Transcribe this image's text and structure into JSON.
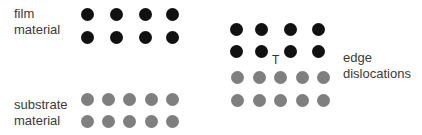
{
  "labels": {
    "film": [
      "film",
      "material"
    ],
    "substrate": [
      "substrate",
      "material"
    ],
    "dislocation": [
      "edge",
      "dislocations"
    ]
  },
  "dislocation_symbol": "T",
  "colors": {
    "film_atom": "#111111",
    "substrate_atom": "#7f7f7f",
    "text": "#3a3a3a",
    "background": "#ffffff"
  },
  "lattices": {
    "left": {
      "film": {
        "rows": 2,
        "cols": 4,
        "x": [
          87,
          116,
          145,
          172
        ],
        "y": [
          14,
          37
        ]
      },
      "substrate": {
        "rows": 2,
        "cols": 5,
        "x": [
          87,
          108,
          129,
          151,
          172
        ],
        "y": [
          99,
          121
        ]
      }
    },
    "right": {
      "film": {
        "rows": 2,
        "cols": 4,
        "x": [
          236,
          261,
          290,
          318
        ],
        "y": [
          29,
          51
        ]
      },
      "substrate": {
        "rows": 2,
        "cols": 5,
        "x": [
          237,
          259,
          280,
          302,
          323
        ],
        "y": [
          77,
          100
        ]
      },
      "dislocation_position": {
        "x": 276,
        "y": 60
      }
    }
  }
}
